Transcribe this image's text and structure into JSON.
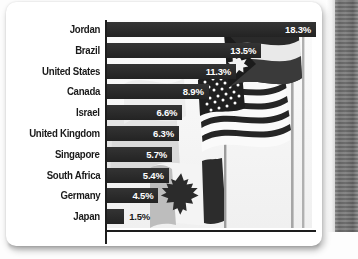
{
  "figure": {
    "media": "scanned-book-page",
    "background_photo": "waving-national-flags-photograph",
    "flags_depicted": [
      "Jordan",
      "United States",
      "Canada"
    ]
  },
  "colors": {
    "bar": "#272727",
    "axis": "#1d1d1d",
    "label_text": "#1a1a1a",
    "value_text_inside": "#ffffff",
    "page": "#ffffff",
    "scan_edge": "#6f6f6f"
  },
  "chart_data": {
    "type": "bar",
    "orientation": "horizontal",
    "title": "",
    "subtitle": "",
    "xlabel": "",
    "ylabel": "",
    "grid": false,
    "legend": false,
    "xlim": [
      0,
      18.3
    ],
    "value_suffix": "%",
    "categories": [
      "Jordan",
      "Brazil",
      "United States",
      "Canada",
      "Israel",
      "United Kingdom",
      "Singapore",
      "South Africa",
      "Germany",
      "Japan"
    ],
    "values": [
      18.3,
      13.5,
      11.3,
      8.9,
      6.6,
      6.3,
      5.7,
      5.4,
      4.5,
      1.5
    ],
    "data_labels": [
      "18.3%",
      "13.5%",
      "11.3%",
      "8.9%",
      "6.6%",
      "6.3%",
      "5.7%",
      "5.4%",
      "4.5%",
      "1.5%"
    ],
    "label_placement": [
      "inside",
      "inside",
      "inside",
      "inside",
      "inside",
      "inside",
      "inside",
      "inside",
      "inside",
      "outside"
    ]
  }
}
